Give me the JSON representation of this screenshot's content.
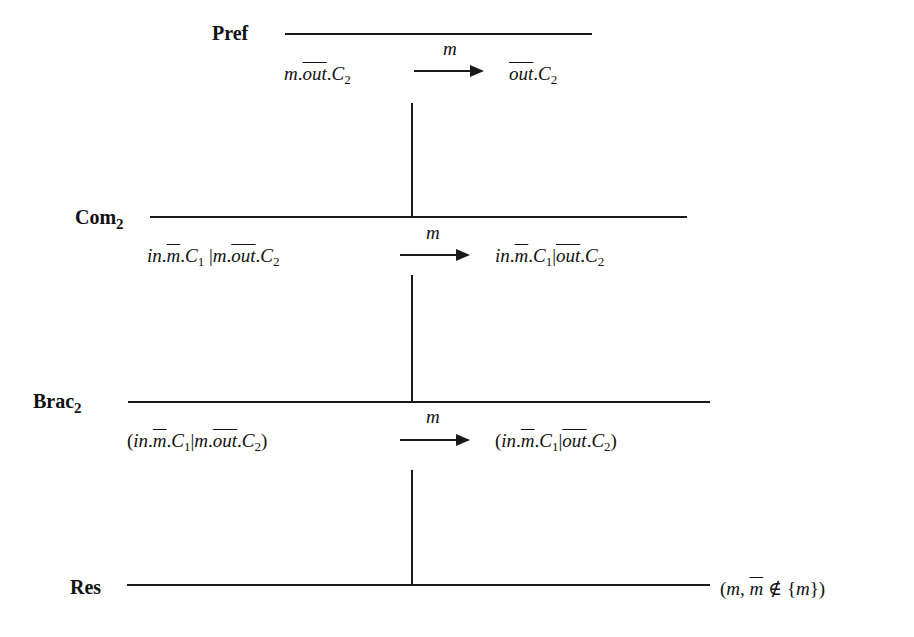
{
  "diagram": {
    "type": "derivation-tree",
    "steps": [
      {
        "rule": "Pref",
        "rule_sub": "",
        "lhs": "m.out.C2",
        "label": "m",
        "rhs": "out.C2"
      },
      {
        "rule": "Com",
        "rule_sub": "2",
        "lhs": "in.m.C1 | m.out.C2",
        "label": "m",
        "rhs": "in.m.C1 | out.C2"
      },
      {
        "rule": "Brac",
        "rule_sub": "2",
        "lhs": "(in.m.C1 | m.out.C2)",
        "label": "m",
        "rhs": "(in.m.C1 | out.C2)"
      },
      {
        "rule": "Res",
        "rule_sub": "",
        "side_condition": "(m, m ∉ {m})"
      }
    ],
    "parts": {
      "m": "m",
      "out": "out",
      "in": "in",
      "C": "C",
      "one": "1",
      "two": "2",
      "lparen": "(",
      "rparen": ")",
      "dot": ".",
      "bar": "|",
      "comma": ", ",
      "notin": " ∉ ",
      "lbrace": "{",
      "rbrace": "})"
    }
  }
}
